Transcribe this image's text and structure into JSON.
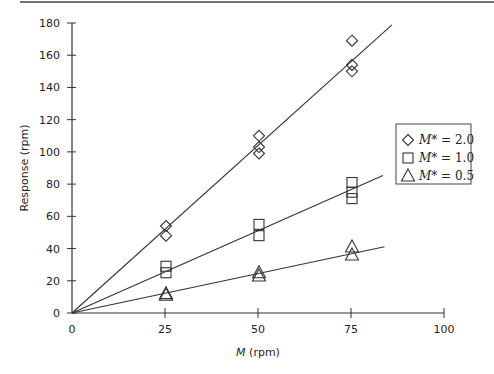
{
  "chart_data": {
    "type": "scatter",
    "title": "",
    "xlabel": "M (rpm)",
    "xlabel_italic": "M",
    "xlabel_rest": " (rpm)",
    "ylabel": "Response (rpm)",
    "xlim": [
      0,
      100
    ],
    "ylim": [
      0,
      180
    ],
    "x_ticks": [
      0,
      25,
      50,
      75,
      100
    ],
    "y_ticks": [
      0,
      20,
      40,
      60,
      80,
      100,
      120,
      140,
      160,
      180
    ],
    "grid": false,
    "legend_position": "right",
    "series": [
      {
        "name": "M* = 2.0",
        "label_italic": "M*",
        "label_rest": " = 2.0",
        "marker": "diamond",
        "points": [
          [
            25,
            48
          ],
          [
            25,
            54
          ],
          [
            50,
            99
          ],
          [
            50,
            103
          ],
          [
            50,
            110
          ],
          [
            75,
            150
          ],
          [
            75,
            154
          ],
          [
            75,
            169
          ]
        ],
        "fit_line": {
          "slope": 2.08,
          "x_end": 86
        }
      },
      {
        "name": "M* = 1.0",
        "label_italic": "M*",
        "label_rest": " = 1.0",
        "marker": "square",
        "points": [
          [
            25,
            25
          ],
          [
            25,
            29
          ],
          [
            50,
            48
          ],
          [
            50,
            55
          ],
          [
            75,
            71
          ],
          [
            75,
            75
          ],
          [
            75,
            81
          ]
        ],
        "fit_line": {
          "slope": 1.02,
          "x_end": 83.6
        }
      },
      {
        "name": "M* = 0.5",
        "label_italic": "M*",
        "label_rest": " = 0.5",
        "marker": "triangle",
        "points": [
          [
            25,
            11
          ],
          [
            25,
            12
          ],
          [
            50,
            23
          ],
          [
            50,
            25
          ],
          [
            75,
            36
          ],
          [
            75,
            41
          ]
        ],
        "fit_line": {
          "slope": 0.49,
          "x_end": 84
        }
      }
    ]
  },
  "colors": {
    "ink": "#333333",
    "background": "#ffffff"
  }
}
